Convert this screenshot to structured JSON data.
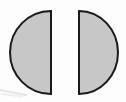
{
  "figure": {
    "title": "Two gray semicircles facing apart",
    "canvas": {
      "width": 126,
      "height": 102,
      "background_color": "#fdfdfd"
    },
    "style": {
      "fill_color": "#c7c7c7",
      "stroke_color": "#1a1a1a",
      "stroke_width": 2
    },
    "shapes": [
      {
        "name": "left-semicircle",
        "type": "semicircle",
        "orientation": "flat-edge-right",
        "bulge_direction": "left",
        "flat_edge_x": 51,
        "outer_extent_x": 10,
        "top_y": 11,
        "bottom_y": 94,
        "radius_x": 41,
        "radius_y": 41.5,
        "center_x": 51,
        "center_y": 52.5,
        "path": "M 51 11 A 41 41.5 0 0 0 51 94 Z",
        "fill_color": "#c7c7c7",
        "stroke_color": "#1a1a1a"
      },
      {
        "name": "right-semicircle",
        "type": "semicircle",
        "orientation": "flat-edge-left",
        "bulge_direction": "right",
        "flat_edge_x": 79,
        "outer_extent_x": 118,
        "top_y": 11,
        "bottom_y": 94,
        "radius_x": 39,
        "radius_y": 41.5,
        "center_x": 79,
        "center_y": 52.5,
        "path": "M 79 11 A 39 41.5 0 0 1 79 94 Z",
        "fill_color": "#c7c7c7",
        "stroke_color": "#1a1a1a"
      }
    ],
    "gap": {
      "name": "center-gap",
      "left_x": 51,
      "right_x": 79,
      "width": 28,
      "color": "#fdfdfd"
    },
    "artifacts": [
      {
        "name": "scan-smudge-streak",
        "description": "faint light gray diagonal streak near bottom-left",
        "x": 0,
        "y": 87,
        "width": 34,
        "height": 9,
        "color": "#dcdcdc"
      }
    ]
  }
}
